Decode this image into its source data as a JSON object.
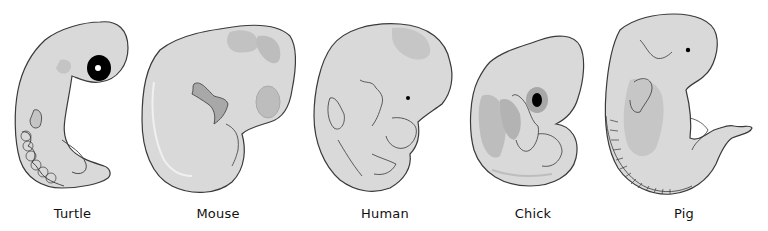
{
  "figure": {
    "type": "embryo-comparison",
    "colors": {
      "body": "#d9d9d9",
      "body_light": "#e6e6e6",
      "shade": "#bdbdbd",
      "dark_shade": "#a8a8a8",
      "outline": "#3a3a3a",
      "eye": "#000000",
      "background": "#ffffff"
    },
    "embryos": [
      {
        "id": "turtle",
        "label": "Turtle"
      },
      {
        "id": "mouse",
        "label": "Mouse"
      },
      {
        "id": "human",
        "label": "Human"
      },
      {
        "id": "chick",
        "label": "Chick"
      },
      {
        "id": "pig",
        "label": "Pig"
      }
    ]
  }
}
